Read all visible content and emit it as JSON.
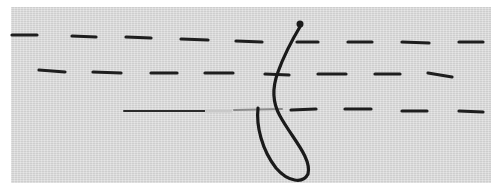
{
  "image": {
    "subject": "Fabric sample showing running stitches with needle thread loop",
    "background_color": "#dcdcdc",
    "stitch_color": "#1e1e1e",
    "rows": [
      {
        "name": "top-row",
        "y": 37,
        "stitch_count": 9
      },
      {
        "name": "middle-row",
        "y": 73,
        "stitch_count": 8
      },
      {
        "name": "bottom-row",
        "y": 110,
        "stitch_count": 6
      }
    ]
  }
}
